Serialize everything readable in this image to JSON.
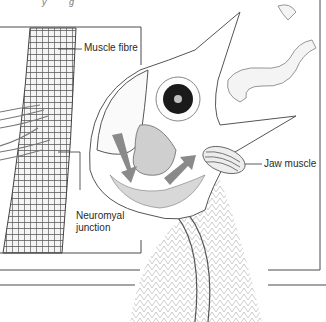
{
  "figure": {
    "top_caption_fragment": "y g",
    "labels": {
      "muscle_fibre": "Muscle fibre",
      "neuromyal_line1": "Neuromyal",
      "neuromyal_line2": "junction",
      "jaw_muscle": "Jaw muscle"
    },
    "subjects": [
      "chick-head",
      "worm",
      "muscle-fibre-bundle",
      "nerve-fibres",
      "jaw-muscle",
      "tongue"
    ],
    "arrows": [
      {
        "name": "downward-arrow",
        "direction": "down"
      },
      {
        "name": "upward-right-arrow",
        "direction": "up-right"
      }
    ],
    "colors": {
      "arrow": "#8a8a8a",
      "frame_line": "#4a4a4a",
      "tongue": "#cfcfcf",
      "eye": "#1a1a1a",
      "background": "#ffffff"
    }
  }
}
